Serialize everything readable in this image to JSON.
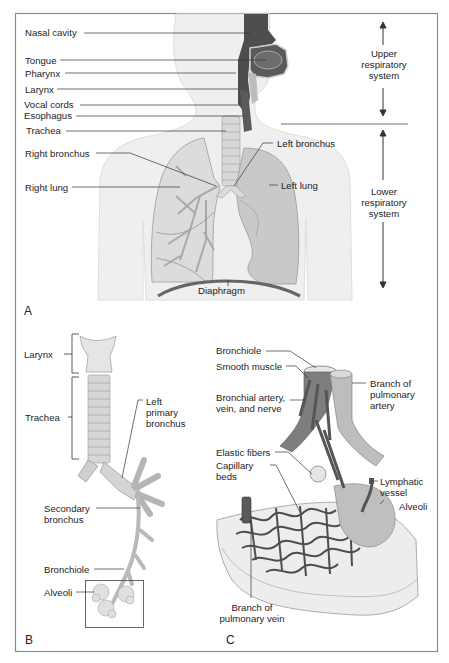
{
  "figure": {
    "panels": [
      {
        "id": "A",
        "letter": "A",
        "labels": {
          "nasal_cavity": "Nasal cavity",
          "tongue": "Tongue",
          "pharynx": "Pharynx",
          "larynx": "Larynx",
          "vocal_cords": "Vocal cords",
          "esophagus": "Esophagus",
          "trachea": "Trachea",
          "right_bronchus": "Right bronchus",
          "left_bronchus": "Left bronchus",
          "right_lung": "Right lung",
          "left_lung": "Left lung",
          "diaphragm": "Diaphragm",
          "upper_system": [
            "Upper",
            "respiratory",
            "system"
          ],
          "lower_system": [
            "Lower",
            "respiratory",
            "system"
          ]
        }
      },
      {
        "id": "B",
        "letter": "B",
        "labels": {
          "larynx": "Larynx",
          "trachea": "Trachea",
          "left_primary_bronchus": [
            "Left",
            "primary",
            "bronchus"
          ],
          "secondary_bronchus": [
            "Secondary",
            "bronchus"
          ],
          "bronchiole": "Bronchiole",
          "alveoli": "Alveoli"
        }
      },
      {
        "id": "C",
        "letter": "C",
        "labels": {
          "bronchiole": "Bronchiole",
          "smooth_muscle": "Smooth muscle",
          "bronchial_avn": [
            "Bronchial artery,",
            "vein, and nerve"
          ],
          "branch_pulmonary_artery": [
            "Branch of",
            "pulmonary",
            "artery"
          ],
          "elastic_fibers": "Elastic fibers",
          "capillary_beds": [
            "Capillary",
            "beds"
          ],
          "lymphatic_vessel": [
            "Lymphatic",
            "vessel"
          ],
          "alveoli": "Alveoli",
          "branch_pulmonary_vein": [
            "Branch of",
            "pulmonary vein"
          ]
        }
      }
    ],
    "colors": {
      "frame": "#8c8c8c",
      "body_fill": "#eeeeee",
      "dark_airway": "#4a4a4a",
      "mid_gray": "#8a8a8a",
      "lung_fill": "#cfcfcf",
      "leader_line": "#333333"
    }
  }
}
